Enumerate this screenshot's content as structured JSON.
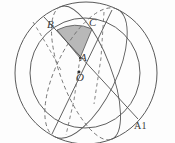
{
  "figure": {
    "caption_label": "A1",
    "points": {
      "B": "B",
      "C": "C",
      "A": "A",
      "O": "O"
    },
    "colors": {
      "stroke": "#5a5a5a",
      "dashed_stroke": "#6e6e6e",
      "shaded_fill": "#b5b5b5",
      "background": "#fdfdfd",
      "label": "#3a3a3a"
    },
    "geometry": {
      "type": "spherical-triangle-diagram",
      "outer_circle": {
        "cx": 86,
        "cy": 73,
        "r": 71
      },
      "inner_circle": {
        "cx": 85,
        "cy": 73,
        "r": 55
      },
      "center_point": {
        "x": 79,
        "y": 73
      },
      "vertex_A": {
        "x": 80,
        "y": 58
      },
      "vertex_B": {
        "x": 57,
        "y": 30
      },
      "vertex_C": {
        "x": 92,
        "y": 29
      },
      "shaded_region": "spherical triangle A-B-C",
      "great_circle_1": "ellipse through B and lower-right, tilted",
      "great_circle_2": "ellipse through C and lower-left, tilted",
      "dashed_arcs": "hidden hemisphere portions of the great circles"
    }
  }
}
